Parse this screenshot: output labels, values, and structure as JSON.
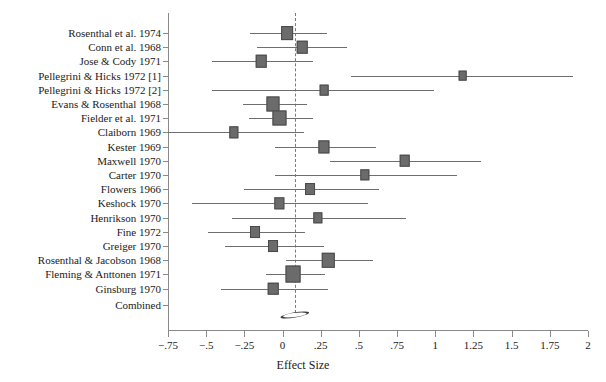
{
  "chart_data": {
    "type": "forest",
    "title": "",
    "xlabel": "Effect Size",
    "ylabel": "",
    "xlim": [
      -0.75,
      2
    ],
    "xticks": [
      -0.75,
      -0.5,
      -0.25,
      0,
      0.25,
      0.5,
      0.75,
      1,
      1.25,
      1.5,
      1.75,
      2
    ],
    "xticklabels": [
      "−.75",
      "−.5",
      "−.25",
      "0",
      ".25",
      ".5",
      ".75",
      "1",
      "1.25",
      "1.5",
      "1.75",
      "2"
    ],
    "grid": false,
    "legend": null,
    "null_line_value": 0.08,
    "null_line_style": "dashed",
    "combined_label": "Combined",
    "combined": {
      "estimate": 0.08,
      "ci_low": -0.01,
      "ci_high": 0.17,
      "marker": "diamond"
    },
    "studies": [
      {
        "label": "Rosenthal et al. 1974",
        "estimate": 0.03,
        "ci_low": -0.21,
        "ci_high": 0.29,
        "weight": 11
      },
      {
        "label": "Conn et al. 1968",
        "estimate": 0.13,
        "ci_low": -0.17,
        "ci_high": 0.42,
        "weight": 9
      },
      {
        "label": "Jose & Cody 1971",
        "estimate": -0.14,
        "ci_low": -0.46,
        "ci_high": 0.2,
        "weight": 9
      },
      {
        "label": "Pellegrini & Hicks 1972 [1]",
        "estimate": 1.18,
        "ci_low": 0.45,
        "ci_high": 1.9,
        "weight": 6
      },
      {
        "label": "Pellegrini & Hicks 1972 [2]",
        "estimate": 0.27,
        "ci_low": -0.46,
        "ci_high": 0.99,
        "weight": 6
      },
      {
        "label": "Evans & Rosenthal 1968",
        "estimate": -0.06,
        "ci_low": -0.26,
        "ci_high": 0.16,
        "weight": 13
      },
      {
        "label": "Fielder et al. 1971",
        "estimate": -0.02,
        "ci_low": -0.22,
        "ci_high": 0.2,
        "weight": 13
      },
      {
        "label": "Claiborn 1969",
        "estimate": -0.32,
        "ci_low": -0.75,
        "ci_high": 0.14,
        "weight": 7
      },
      {
        "label": "Kester 1969",
        "estimate": 0.27,
        "ci_low": -0.05,
        "ci_high": 0.61,
        "weight": 10
      },
      {
        "label": "Maxwell 1970",
        "estimate": 0.8,
        "ci_low": 0.31,
        "ci_high": 1.3,
        "weight": 9
      },
      {
        "label": "Carter 1970",
        "estimate": 0.54,
        "ci_low": -0.05,
        "ci_high": 1.14,
        "weight": 7
      },
      {
        "label": "Flowers 1966",
        "estimate": 0.18,
        "ci_low": -0.25,
        "ci_high": 0.63,
        "weight": 8
      },
      {
        "label": "Keshock 1970",
        "estimate": -0.02,
        "ci_low": -0.59,
        "ci_high": 0.56,
        "weight": 7
      },
      {
        "label": "Henrikson 1970",
        "estimate": 0.23,
        "ci_low": -0.33,
        "ci_high": 0.81,
        "weight": 7
      },
      {
        "label": "Fine 1972",
        "estimate": -0.18,
        "ci_low": -0.49,
        "ci_high": 0.15,
        "weight": 8
      },
      {
        "label": "Greiger 1970",
        "estimate": -0.06,
        "ci_low": -0.38,
        "ci_high": 0.27,
        "weight": 8
      },
      {
        "label": "Rosenthal & Jacobson 1968",
        "estimate": 0.3,
        "ci_low": 0.02,
        "ci_high": 0.59,
        "weight": 12
      },
      {
        "label": "Fleming & Anttonen 1971",
        "estimate": 0.07,
        "ci_low": -0.11,
        "ci_high": 0.28,
        "weight": 16
      },
      {
        "label": "Ginsburg 1970",
        "estimate": -0.06,
        "ci_low": -0.4,
        "ci_high": 0.3,
        "weight": 9
      }
    ]
  }
}
